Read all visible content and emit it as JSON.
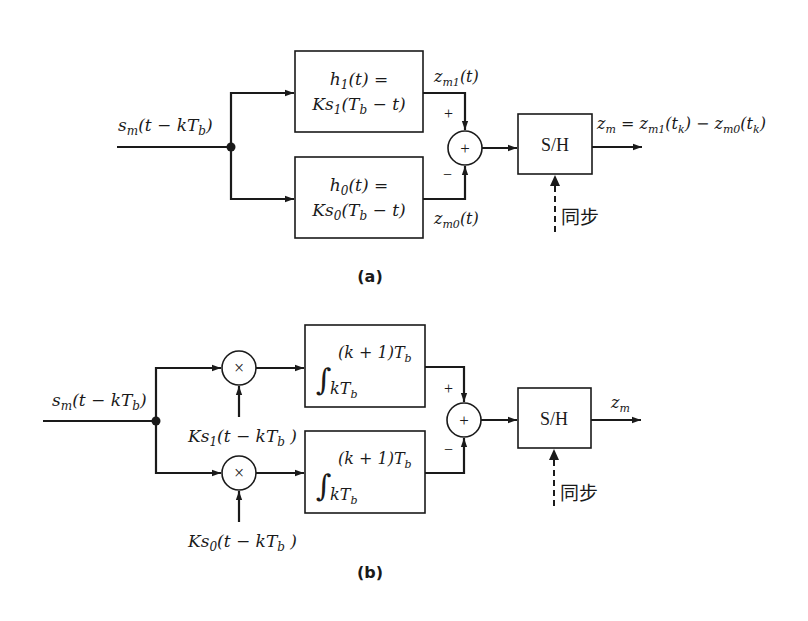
{
  "diagram_a": {
    "caption": "(a)",
    "input_label": "sm(t − kTb)",
    "filter_top": {
      "line1": "h1(t) =",
      "line2": "Ks1(Tb − t)"
    },
    "filter_bottom": {
      "line1": "h0(t) =",
      "line2": "Ks0(Tb − t)"
    },
    "output_top_label": "zm1(t)",
    "output_bottom_label": "zm0(t)",
    "sign_plus": "+",
    "sign_minus": "−",
    "summer_symbol": "+",
    "sh_label": "S/H",
    "sync_label": "同步",
    "output_label": "zm = zm1(tk) − zm0(tk)"
  },
  "diagram_b": {
    "caption": "(b)",
    "input_label": "sm(t − kTb)",
    "multiplier_symbol": "×",
    "ref_top_label": "Ks1(t − kTb )",
    "ref_bottom_label": "Ks0(t − kTb )",
    "integrator_upper_limit": "(k + 1)Tb",
    "integrator_lower_limit": "kTb",
    "sign_plus": "+",
    "sign_minus": "−",
    "summer_symbol": "+",
    "sh_label": "S/H",
    "sync_label": "同步",
    "output_label": "zm"
  }
}
